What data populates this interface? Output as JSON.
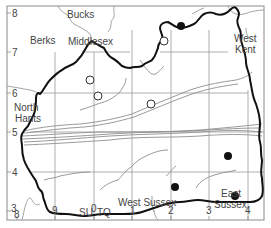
{
  "map": {
    "frame": {
      "x": 7,
      "y": 6,
      "w": 257,
      "h": 214
    },
    "grid": {
      "x_ticks": [
        {
          "label": "8",
          "x": 17
        },
        {
          "label": "9",
          "x": 55
        },
        {
          "label": "0",
          "x": 94
        },
        {
          "label": "1",
          "x": 132
        },
        {
          "label": "2",
          "x": 171
        },
        {
          "label": "3",
          "x": 209
        },
        {
          "label": "4",
          "x": 248
        }
      ],
      "y_ticks": [
        {
          "label": "8",
          "y": 13
        },
        {
          "label": "7",
          "y": 52
        },
        {
          "label": "6",
          "y": 93
        },
        {
          "label": "5",
          "y": 132
        },
        {
          "label": "4",
          "y": 172
        },
        {
          "label": "3",
          "y": 211
        }
      ],
      "grid_square_left": "SU",
      "grid_square_right": "TQ"
    },
    "region_labels": [
      {
        "text": "Bucks",
        "x": 67,
        "y": 18
      },
      {
        "text": "Berks",
        "x": 30,
        "y": 44
      },
      {
        "text": "Middlesex",
        "x": 68,
        "y": 45
      },
      {
        "text": "West",
        "x": 234,
        "y": 42
      },
      {
        "text": "Kent",
        "x": 234,
        "y": 53
      },
      {
        "text": "North",
        "x": 15,
        "y": 111
      },
      {
        "text": "Hants",
        "x": 15,
        "y": 122
      },
      {
        "text": "West Sussex",
        "x": 118,
        "y": 206
      },
      {
        "text": "East",
        "x": 221,
        "y": 197
      },
      {
        "text": "Sussex",
        "x": 214,
        "y": 208
      }
    ],
    "records": {
      "filled": [
        {
          "x": 181,
          "y": 26
        },
        {
          "x": 228,
          "y": 156
        },
        {
          "x": 175,
          "y": 187
        },
        {
          "x": 235,
          "y": 196
        }
      ],
      "open": [
        {
          "x": 164,
          "y": 41
        },
        {
          "x": 90,
          "y": 80
        },
        {
          "x": 98,
          "y": 96
        },
        {
          "x": 151,
          "y": 104
        }
      ]
    },
    "colors": {
      "county_boundary": "#111111",
      "neighbour_boundary": "#9a9a9a",
      "grid": "#8a8a8a",
      "river": "#8f8f8f",
      "filled_point": "#111111",
      "open_point_stroke": "#333333"
    }
  }
}
